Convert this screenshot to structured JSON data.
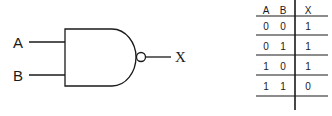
{
  "gate": {
    "type": "NAND",
    "inputs": [
      {
        "label": "A"
      },
      {
        "label": "B"
      }
    ],
    "output": {
      "label": "X"
    }
  },
  "truth_table": {
    "headers": [
      "A",
      "B",
      "X"
    ],
    "rows": [
      [
        "0",
        "0",
        "1"
      ],
      [
        "0",
        "1",
        "1"
      ],
      [
        "1",
        "0",
        "1"
      ],
      [
        "1",
        "1",
        "0"
      ]
    ]
  }
}
